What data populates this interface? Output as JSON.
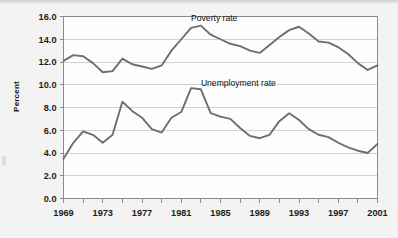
{
  "figure": {
    "background_color": "#f3f3f3",
    "plot_background_color": "#fdfdfd",
    "line_color": "#6e6e6e",
    "grid_color": "#d2d2d2",
    "axis_color": "#8a8a8a",
    "y_axis_title": "Percent"
  },
  "chart_data": {
    "type": "line",
    "title": "",
    "subtitle": "",
    "xlabel": "",
    "ylabel": "Percent",
    "xlim": [
      1969,
      2001
    ],
    "ylim": [
      0.0,
      16.0
    ],
    "grid": "horizontal",
    "legend_position": "inline-annotation",
    "y_ticks": [
      "0.0",
      "2.0",
      "4.0",
      "6.0",
      "8.0",
      "10.0",
      "12.0",
      "14.0",
      "16.0"
    ],
    "y_tick_values": [
      0.0,
      2.0,
      4.0,
      6.0,
      8.0,
      10.0,
      12.0,
      14.0,
      16.0
    ],
    "x_ticks": [
      "1969",
      "1973",
      "1977",
      "1981",
      "1985",
      "1989",
      "1993",
      "1997",
      "2001"
    ],
    "x_tick_values": [
      1969,
      1973,
      1977,
      1981,
      1985,
      1989,
      1993,
      1997,
      2001
    ],
    "x_minor_tick_interval": 2,
    "x": [
      1969,
      1970,
      1971,
      1972,
      1973,
      1974,
      1975,
      1976,
      1977,
      1978,
      1979,
      1980,
      1981,
      1982,
      1983,
      1984,
      1985,
      1986,
      1987,
      1988,
      1989,
      1990,
      1991,
      1992,
      1993,
      1994,
      1995,
      1996,
      1997,
      1998,
      1999,
      2000,
      2001
    ],
    "annotations": [
      {
        "text": "Poverty rate",
        "x": 1982,
        "y": 15.6
      },
      {
        "text": "Unemployment rate",
        "x": 1983,
        "y": 9.9
      }
    ],
    "series": [
      {
        "name": "Poverty rate",
        "label": "Poverty rate",
        "color": "#6e6e6e",
        "values": [
          12.1,
          12.6,
          12.5,
          11.9,
          11.1,
          11.2,
          12.3,
          11.8,
          11.6,
          11.4,
          11.7,
          13.0,
          14.0,
          15.0,
          15.2,
          14.4,
          14.0,
          13.6,
          13.4,
          13.0,
          12.8,
          13.5,
          14.2,
          14.8,
          15.1,
          14.5,
          13.8,
          13.7,
          13.3,
          12.7,
          11.9,
          11.3,
          11.7
        ]
      },
      {
        "name": "Unemployment rate",
        "label": "Unemployment rate",
        "color": "#6e6e6e",
        "values": [
          3.5,
          4.9,
          5.9,
          5.6,
          4.9,
          5.6,
          8.5,
          7.7,
          7.1,
          6.1,
          5.8,
          7.1,
          7.6,
          9.7,
          9.6,
          7.5,
          7.2,
          7.0,
          6.2,
          5.5,
          5.3,
          5.6,
          6.8,
          7.5,
          6.9,
          6.1,
          5.6,
          5.4,
          4.9,
          4.5,
          4.2,
          4.0,
          4.8
        ]
      }
    ]
  }
}
